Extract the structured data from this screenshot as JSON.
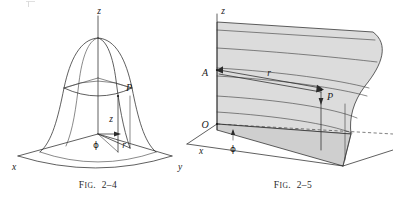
{
  "page": {
    "background_color": "#ffffff",
    "ink_color": "#2b2b2b",
    "surface_fill_color": "#dcdcdc"
  },
  "figures": [
    {
      "id": "fig-2-4",
      "caption_prefix": "F",
      "caption_small": "IG",
      "caption_number": "2–4",
      "caption_full": "Fig. 2–4",
      "description": "Bell-shaped surface of revolution over cylindrical coordinate axes",
      "axes": [
        {
          "name": "x",
          "label": "x"
        },
        {
          "name": "y",
          "label": "y"
        },
        {
          "name": "z",
          "label": "z"
        }
      ],
      "labels": [
        {
          "name": "point-p",
          "label": "P"
        },
        {
          "name": "height-z",
          "label": "z"
        },
        {
          "name": "radius-r",
          "label": "r"
        },
        {
          "name": "azimuth-phi",
          "label": "ϕ"
        }
      ]
    },
    {
      "id": "fig-2-5",
      "caption_prefix": "F",
      "caption_small": "IG",
      "caption_number": "2–5",
      "caption_full": "Fig. 2–5",
      "description": "Shaded vertical ruled surface with radial vector r from axis to point P",
      "axes": [
        {
          "name": "x",
          "label": "x"
        },
        {
          "name": "z",
          "label": "z"
        }
      ],
      "labels": [
        {
          "name": "origin-o",
          "label": "O"
        },
        {
          "name": "point-a",
          "label": "A"
        },
        {
          "name": "point-p",
          "label": "P"
        },
        {
          "name": "radius-r",
          "label": "r"
        },
        {
          "name": "azimuth-phi",
          "label": "ϕ"
        }
      ]
    }
  ]
}
